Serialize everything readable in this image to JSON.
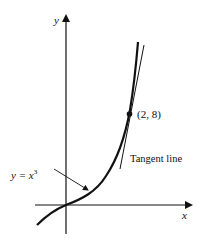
{
  "figure": {
    "axes": {
      "x_label": "x",
      "y_label": "y"
    },
    "curve": {
      "equation_lhs": "y = x",
      "equation_exponent": "3",
      "label": "y = x³"
    },
    "point": {
      "label": "(2, 8)",
      "x": 2,
      "y": 8
    },
    "tangent": {
      "label": "Tangent line"
    },
    "colors": {
      "ink": "#111111",
      "background": "#ffffff"
    }
  }
}
